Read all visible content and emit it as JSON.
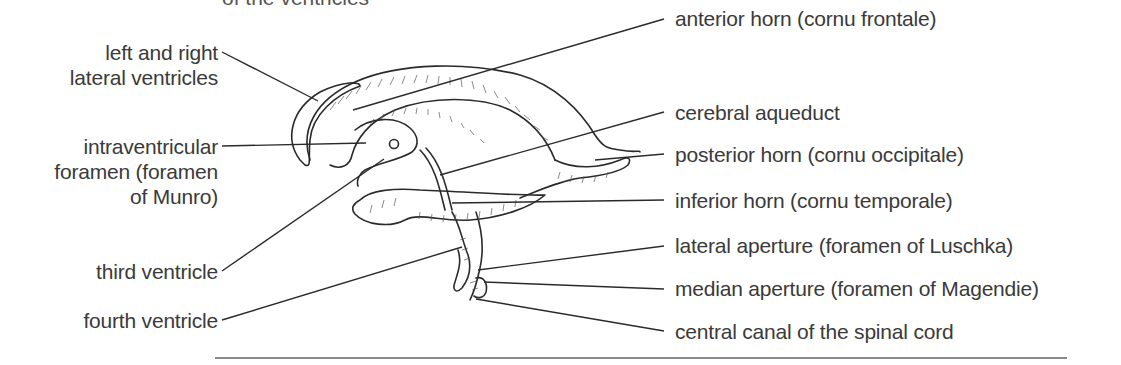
{
  "figure": {
    "title_cropped": "of the ventricles"
  },
  "labels_left": [
    {
      "id": "lateral-ventricles",
      "lines": [
        "left and right",
        "lateral ventricles"
      ]
    },
    {
      "id": "intraventricular-foramen",
      "lines": [
        "intraventricular",
        "foramen (foramen",
        "of Munro)"
      ]
    },
    {
      "id": "third-ventricle",
      "lines": [
        "third ventricle"
      ]
    },
    {
      "id": "fourth-ventricle",
      "lines": [
        "fourth ventricle"
      ]
    }
  ],
  "labels_right": [
    {
      "id": "anterior-horn",
      "text": "anterior horn (cornu frontale)"
    },
    {
      "id": "cerebral-aqueduct",
      "text": "cerebral aqueduct"
    },
    {
      "id": "posterior-horn",
      "text": "posterior horn (cornu occipitale)"
    },
    {
      "id": "inferior-horn",
      "text": "inferior horn (cornu temporale)"
    },
    {
      "id": "lateral-aperture",
      "text": "lateral aperture (foramen of Luschka)"
    },
    {
      "id": "median-aperture",
      "text": "median aperture (foramen of Magendie)"
    },
    {
      "id": "central-canal",
      "text": "central canal of the spinal cord"
    }
  ],
  "colors": {
    "text": "#3a3a3a",
    "line": "#2a2a2a",
    "rule": "#8a8a8a",
    "background": "#ffffff"
  }
}
